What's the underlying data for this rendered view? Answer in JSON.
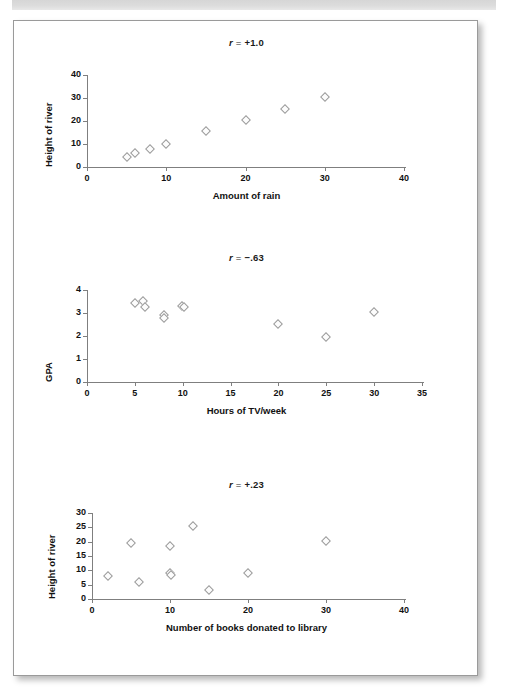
{
  "page": {
    "background_color": "#ffffff",
    "card_border_color": "#9a9a9a",
    "band_color": "#d9d9d9",
    "marker_color": "#9b9b9b",
    "axis_color": "#7f7f7f"
  },
  "chart_data": [
    {
      "type": "scatter",
      "title": "r = +1.0",
      "title_r": "r",
      "title_eq": "=",
      "title_value": "+1.0",
      "xlabel": "Amount of rain",
      "ylabel": "Height of river",
      "xlim": [
        0,
        40
      ],
      "ylim": [
        0,
        40
      ],
      "xticks": [
        0,
        10,
        20,
        30,
        40
      ],
      "yticks": [
        0,
        10,
        20,
        30,
        40
      ],
      "xticklabels": [
        "0",
        "10",
        "20",
        "30",
        "40"
      ],
      "yticklabels": [
        "0",
        "10",
        "20",
        "30",
        "40"
      ],
      "grid": false,
      "legend": "none",
      "points": [
        {
          "x": 5,
          "y": 4.5
        },
        {
          "x": 6,
          "y": 6.3
        },
        {
          "x": 8,
          "y": 8.0
        },
        {
          "x": 10,
          "y": 10.2
        },
        {
          "x": 15,
          "y": 15.5
        },
        {
          "x": 20,
          "y": 20.3
        },
        {
          "x": 25,
          "y": 25.4
        },
        {
          "x": 30,
          "y": 30.4
        }
      ]
    },
    {
      "type": "scatter",
      "title": "r = -.63",
      "title_r": "r",
      "title_eq": "=",
      "title_value": "−.63",
      "xlabel": "Hours of TV/week",
      "ylabel": "GPA",
      "xlim": [
        0,
        35
      ],
      "ylim": [
        0,
        4
      ],
      "xticks": [
        0,
        5,
        10,
        15,
        20,
        25,
        30,
        35
      ],
      "yticks": [
        0,
        1,
        2,
        3,
        4
      ],
      "xticklabels": [
        "0",
        "5",
        "10",
        "15",
        "20",
        "25",
        "30",
        "35"
      ],
      "yticklabels": [
        "0",
        "1",
        "2",
        "3",
        "4"
      ],
      "grid": false,
      "legend": "none",
      "points": [
        {
          "x": 5.0,
          "y": 3.45
        },
        {
          "x": 5.9,
          "y": 3.52
        },
        {
          "x": 6.1,
          "y": 3.28
        },
        {
          "x": 8.0,
          "y": 2.9
        },
        {
          "x": 8.05,
          "y": 2.78
        },
        {
          "x": 9.9,
          "y": 3.32
        },
        {
          "x": 10.1,
          "y": 3.28
        },
        {
          "x": 20.0,
          "y": 2.52
        },
        {
          "x": 25.0,
          "y": 1.97
        },
        {
          "x": 30.0,
          "y": 3.05
        }
      ]
    },
    {
      "type": "scatter",
      "title": "r = +.23",
      "title_r": "r",
      "title_eq": "=",
      "title_value": "+.23",
      "xlabel": "Number of books donated to library",
      "ylabel": "Height of river",
      "xlim": [
        0,
        40
      ],
      "ylim": [
        0,
        30
      ],
      "xticks": [
        0,
        10,
        20,
        30,
        40
      ],
      "yticks": [
        0,
        5,
        10,
        15,
        20,
        25,
        30
      ],
      "xticklabels": [
        "0",
        "10",
        "20",
        "30",
        "40"
      ],
      "yticklabels": [
        "0",
        "5",
        "10",
        "15",
        "20",
        "25",
        "30"
      ],
      "grid": false,
      "legend": "none",
      "points": [
        {
          "x": 2.0,
          "y": 8.0
        },
        {
          "x": 5.0,
          "y": 19.7
        },
        {
          "x": 6.0,
          "y": 5.9
        },
        {
          "x": 10.0,
          "y": 18.4
        },
        {
          "x": 10.0,
          "y": 9.0
        },
        {
          "x": 10.1,
          "y": 8.2
        },
        {
          "x": 13.0,
          "y": 25.3
        },
        {
          "x": 15.0,
          "y": 3.1
        },
        {
          "x": 20.0,
          "y": 9.0
        },
        {
          "x": 30.0,
          "y": 20.2
        }
      ]
    }
  ]
}
